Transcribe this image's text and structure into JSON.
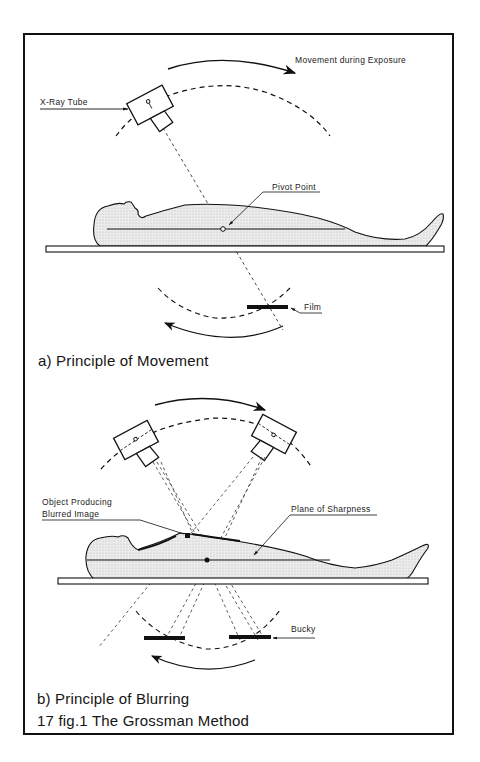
{
  "figure": {
    "title": "17 fig.1 The Grossman Method",
    "panel_a": {
      "caption": "a) Principle of Movement",
      "labels": {
        "movement": "Movement during Exposure",
        "tube": "X-Ray Tube",
        "pivot": "Pivot Point",
        "film": "Film"
      }
    },
    "panel_b": {
      "caption": "b) Principle of Blurring",
      "labels": {
        "object_line1": "Object Producing",
        "object_line2": "Blurred Image",
        "plane": "Plane of Sharpness",
        "bucky": "Bucky"
      }
    },
    "colors": {
      "ink": "#111111",
      "body_fill": "#e6e6e6",
      "background": "#ffffff"
    }
  }
}
